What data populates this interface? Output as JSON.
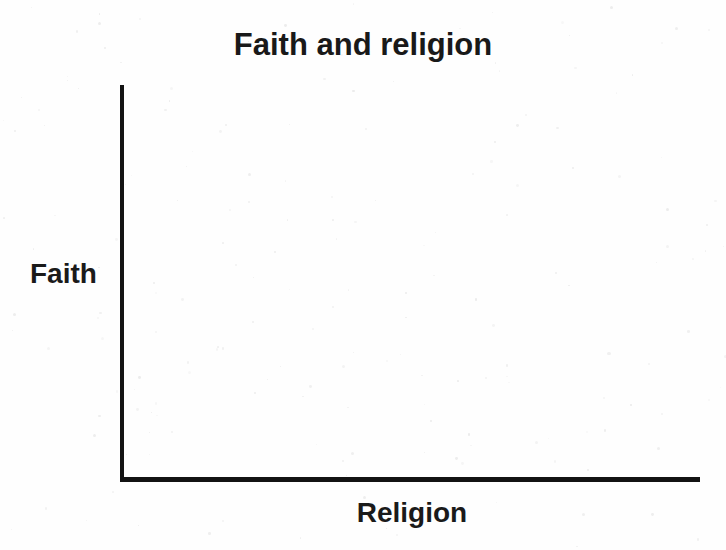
{
  "chart_data": {
    "type": "line",
    "title": "Faith and religion",
    "xlabel": "Religion",
    "ylabel": "Faith",
    "subtitle": "",
    "categories": [],
    "x": [],
    "values": [],
    "series": [],
    "annotations": [],
    "legend": [],
    "legend_position": "none",
    "grid": false,
    "xticks": [],
    "yticks": [],
    "xlim": null,
    "ylim": null,
    "note": "Empty axes only: no plotted data, no tick marks, no gridlines, no legend."
  },
  "figure": {
    "title": "Faith and religion",
    "y_axis_label": "Faith",
    "x_axis_label": "Religion",
    "colors": {
      "axis": "#131313",
      "text": "#1a1a1a",
      "background": "#fefefe"
    }
  }
}
